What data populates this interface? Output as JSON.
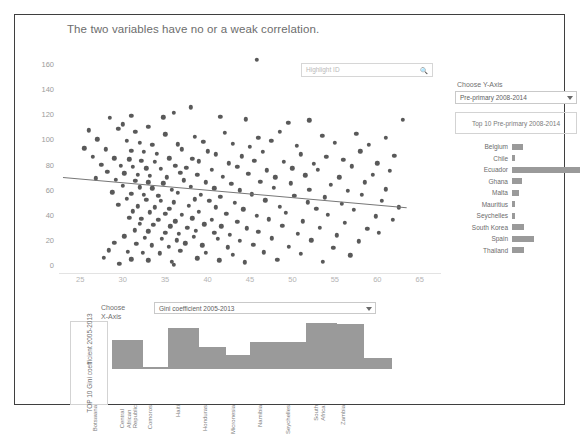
{
  "header": {
    "title": "The two variables have no or a weak correlation."
  },
  "search": {
    "placeholder": "Highlight ID",
    "icon": "magnifier-icon",
    "value": ""
  },
  "controls": {
    "y_axis_caption": "Choose Y-Axis",
    "y_axis_selected": "Pre-primary 2008-2014",
    "y_axis_top_label": "Top 10 Pre-primary 2008-2014",
    "x_axis_caption_line1": "Choose",
    "x_axis_caption_line2": "X-Axis",
    "x_axis_selected": "Gini coefficient 2005-2013",
    "dropdown_icon": "chevron-down-icon"
  },
  "bottom_panel": {
    "vertical_title": "TOP 10 Gini coefficient 2005-2013"
  },
  "colors": {
    "marker": "#595959",
    "bar": "#9a9a9a",
    "trendline": "#777777",
    "frame": "#3f3f3f",
    "axis_text": "#9b9b9b"
  },
  "chart_data": [
    {
      "type": "scatter",
      "title": "The two variables have no or a weak correlation.",
      "xlabel": "Gini coefficient 2005-2013",
      "ylabel": "Pre-primary 2008-2014",
      "xlim": [
        22.5,
        67.5
      ],
      "ylim": [
        -6,
        170
      ],
      "xticks": [
        25,
        30,
        35,
        40,
        45,
        50,
        55,
        60,
        65
      ],
      "yticks": [
        0,
        20,
        40,
        60,
        80,
        100,
        120,
        140,
        160
      ],
      "grid": false,
      "legend": "none",
      "trendline": {
        "x0": 23.0,
        "y0": 70.0,
        "x1": 63.5,
        "y1": 46.0
      },
      "points": [
        [
          45.8,
          163.0
        ],
        [
          38.0,
          125.5
        ],
        [
          31.0,
          118.5
        ],
        [
          28.5,
          117.0
        ],
        [
          34.8,
          117.5
        ],
        [
          41.5,
          118.0
        ],
        [
          44.5,
          116.0
        ],
        [
          52.0,
          115.0
        ],
        [
          63.0,
          115.5
        ],
        [
          30.0,
          112.0
        ],
        [
          33.0,
          110.0
        ],
        [
          36.0,
          121.0
        ],
        [
          49.5,
          113.0
        ],
        [
          26.0,
          107.0
        ],
        [
          29.5,
          108.5
        ],
        [
          31.5,
          106.0
        ],
        [
          35.0,
          104.0
        ],
        [
          38.5,
          102.0
        ],
        [
          42.0,
          105.0
        ],
        [
          46.0,
          101.0
        ],
        [
          48.5,
          106.0
        ],
        [
          53.5,
          103.0
        ],
        [
          57.5,
          104.5
        ],
        [
          61.0,
          101.0
        ],
        [
          27.0,
          100.0
        ],
        [
          30.5,
          99.0
        ],
        [
          32.0,
          97.0
        ],
        [
          33.5,
          95.5
        ],
        [
          36.5,
          96.0
        ],
        [
          39.5,
          98.0
        ],
        [
          43.0,
          96.5
        ],
        [
          45.0,
          94.0
        ],
        [
          47.5,
          99.0
        ],
        [
          50.5,
          95.0
        ],
        [
          55.0,
          97.0
        ],
        [
          59.0,
          95.5
        ],
        [
          25.5,
          93.0
        ],
        [
          28.0,
          92.0
        ],
        [
          31.0,
          91.0
        ],
        [
          32.5,
          90.0
        ],
        [
          34.0,
          88.5
        ],
        [
          37.0,
          92.0
        ],
        [
          40.0,
          90.5
        ],
        [
          41.0,
          88.0
        ],
        [
          44.0,
          86.5
        ],
        [
          46.5,
          90.0
        ],
        [
          51.0,
          88.0
        ],
        [
          54.0,
          86.0
        ],
        [
          58.0,
          90.5
        ],
        [
          62.0,
          87.0
        ],
        [
          26.5,
          86.0
        ],
        [
          29.0,
          85.0
        ],
        [
          30.8,
          84.0
        ],
        [
          32.2,
          83.0
        ],
        [
          33.8,
          82.0
        ],
        [
          35.5,
          85.0
        ],
        [
          38.2,
          84.5
        ],
        [
          39.0,
          82.5
        ],
        [
          42.5,
          81.0
        ],
        [
          45.5,
          83.0
        ],
        [
          49.0,
          82.0
        ],
        [
          52.5,
          80.5
        ],
        [
          56.0,
          83.5
        ],
        [
          60.0,
          81.0
        ],
        [
          27.5,
          80.0
        ],
        [
          29.8,
          79.0
        ],
        [
          31.2,
          78.0
        ],
        [
          32.8,
          77.0
        ],
        [
          34.5,
          76.5
        ],
        [
          36.2,
          79.0
        ],
        [
          37.5,
          77.5
        ],
        [
          40.5,
          76.0
        ],
        [
          43.5,
          78.0
        ],
        [
          47.0,
          75.5
        ],
        [
          50.0,
          77.0
        ],
        [
          53.0,
          76.0
        ],
        [
          57.0,
          78.5
        ],
        [
          61.5,
          75.0
        ],
        [
          28.2,
          74.0
        ],
        [
          30.2,
          73.0
        ],
        [
          31.8,
          72.0
        ],
        [
          33.2,
          71.0
        ],
        [
          35.2,
          70.0
        ],
        [
          36.8,
          73.5
        ],
        [
          38.8,
          72.0
        ],
        [
          41.8,
          70.5
        ],
        [
          44.8,
          72.5
        ],
        [
          48.0,
          70.0
        ],
        [
          51.5,
          71.5
        ],
        [
          55.5,
          70.0
        ],
        [
          59.5,
          72.0
        ],
        [
          26.8,
          69.0
        ],
        [
          29.2,
          68.0
        ],
        [
          31.5,
          67.0
        ],
        [
          33.0,
          66.0
        ],
        [
          34.8,
          65.0
        ],
        [
          37.2,
          67.5
        ],
        [
          39.8,
          66.0
        ],
        [
          42.8,
          64.5
        ],
        [
          46.2,
          66.5
        ],
        [
          49.8,
          65.0
        ],
        [
          54.5,
          64.0
        ],
        [
          58.5,
          66.0
        ],
        [
          30.0,
          63.0
        ],
        [
          32.0,
          62.0
        ],
        [
          33.5,
          61.0
        ],
        [
          35.8,
          60.0
        ],
        [
          38.0,
          62.5
        ],
        [
          40.8,
          61.0
        ],
        [
          43.8,
          59.5
        ],
        [
          47.8,
          61.5
        ],
        [
          52.0,
          60.0
        ],
        [
          56.5,
          59.0
        ],
        [
          61.0,
          60.5
        ],
        [
          28.8,
          58.0
        ],
        [
          31.0,
          57.0
        ],
        [
          32.5,
          56.0
        ],
        [
          34.2,
          55.0
        ],
        [
          36.5,
          57.5
        ],
        [
          39.2,
          56.0
        ],
        [
          41.5,
          54.5
        ],
        [
          45.2,
          56.5
        ],
        [
          50.2,
          55.0
        ],
        [
          53.8,
          54.0
        ],
        [
          58.2,
          56.0
        ],
        [
          30.5,
          53.0
        ],
        [
          32.8,
          52.0
        ],
        [
          34.5,
          51.0
        ],
        [
          36.0,
          50.0
        ],
        [
          38.5,
          52.5
        ],
        [
          40.2,
          51.0
        ],
        [
          43.2,
          49.5
        ],
        [
          46.8,
          51.5
        ],
        [
          51.8,
          50.0
        ],
        [
          55.8,
          49.0
        ],
        [
          60.5,
          51.0
        ],
        [
          29.5,
          48.0
        ],
        [
          31.8,
          47.0
        ],
        [
          33.8,
          46.0
        ],
        [
          35.5,
          45.0
        ],
        [
          37.8,
          47.5
        ],
        [
          41.0,
          46.0
        ],
        [
          44.2,
          44.5
        ],
        [
          48.5,
          46.5
        ],
        [
          52.8,
          45.0
        ],
        [
          57.2,
          44.0
        ],
        [
          62.5,
          46.0
        ],
        [
          31.2,
          43.0
        ],
        [
          33.2,
          42.0
        ],
        [
          35.0,
          41.0
        ],
        [
          37.0,
          40.0
        ],
        [
          39.0,
          42.5
        ],
        [
          42.2,
          41.0
        ],
        [
          45.8,
          39.5
        ],
        [
          49.2,
          41.5
        ],
        [
          54.2,
          40.0
        ],
        [
          59.8,
          39.0
        ],
        [
          30.8,
          38.0
        ],
        [
          32.2,
          37.0
        ],
        [
          34.2,
          36.0
        ],
        [
          36.2,
          35.0
        ],
        [
          38.2,
          37.5
        ],
        [
          40.5,
          36.0
        ],
        [
          43.5,
          34.5
        ],
        [
          47.2,
          36.5
        ],
        [
          51.2,
          35.0
        ],
        [
          56.2,
          34.0
        ],
        [
          61.8,
          36.0
        ],
        [
          32.0,
          33.0
        ],
        [
          33.6,
          32.0
        ],
        [
          35.6,
          31.0
        ],
        [
          37.6,
          30.0
        ],
        [
          39.6,
          32.5
        ],
        [
          41.6,
          31.0
        ],
        [
          44.6,
          29.5
        ],
        [
          48.8,
          31.5
        ],
        [
          53.2,
          30.0
        ],
        [
          58.8,
          29.0
        ],
        [
          31.4,
          28.0
        ],
        [
          33.0,
          27.0
        ],
        [
          35.0,
          26.0
        ],
        [
          36.6,
          25.0
        ],
        [
          38.6,
          27.5
        ],
        [
          40.8,
          26.0
        ],
        [
          42.6,
          24.5
        ],
        [
          46.0,
          26.5
        ],
        [
          50.6,
          25.0
        ],
        [
          55.2,
          24.0
        ],
        [
          60.2,
          26.0
        ],
        [
          30.2,
          23.0
        ],
        [
          32.6,
          22.0
        ],
        [
          34.6,
          21.0
        ],
        [
          36.4,
          20.0
        ],
        [
          38.4,
          22.5
        ],
        [
          41.2,
          21.0
        ],
        [
          43.8,
          19.5
        ],
        [
          47.6,
          21.5
        ],
        [
          52.2,
          20.0
        ],
        [
          57.8,
          19.0
        ],
        [
          29.0,
          18.0
        ],
        [
          31.6,
          17.0
        ],
        [
          33.4,
          16.0
        ],
        [
          35.4,
          15.0
        ],
        [
          37.4,
          17.5
        ],
        [
          39.4,
          16.0
        ],
        [
          42.4,
          14.5
        ],
        [
          45.4,
          16.5
        ],
        [
          49.6,
          15.0
        ],
        [
          54.8,
          14.0
        ],
        [
          28.4,
          12.0
        ],
        [
          30.6,
          11.0
        ],
        [
          32.4,
          10.0
        ],
        [
          34.4,
          9.5
        ],
        [
          36.8,
          11.5
        ],
        [
          39.8,
          10.0
        ],
        [
          43.0,
          8.5
        ],
        [
          46.6,
          10.5
        ],
        [
          51.0,
          9.0
        ],
        [
          56.8,
          8.0
        ],
        [
          27.8,
          6.0
        ],
        [
          31.0,
          5.0
        ],
        [
          33.0,
          4.0
        ],
        [
          35.8,
          3.0
        ],
        [
          38.8,
          5.5
        ],
        [
          41.4,
          4.0
        ],
        [
          44.4,
          2.5
        ],
        [
          48.2,
          4.5
        ],
        [
          53.6,
          3.0
        ],
        [
          29.6,
          1.5
        ],
        [
          36.0,
          0.5
        ]
      ]
    },
    {
      "type": "bar",
      "title": "Top 10 Pre-primary 2008-2014",
      "orientation": "horizontal",
      "categories": [
        "Belgium",
        "Chile",
        "Ecuador",
        "Ghana",
        "Malta",
        "Mauritius",
        "Seychelles",
        "South Korea",
        "Spain",
        "Thailand"
      ],
      "values": [
        16,
        5,
        100,
        15,
        10,
        4,
        4,
        17,
        32,
        17
      ],
      "xlabel": "",
      "ylabel": "",
      "grid": false,
      "legend": "none"
    },
    {
      "type": "bar",
      "title": "TOP 10 Gini coefficient 2005-2013",
      "orientation": "vertical",
      "categories": [
        "Botswana",
        "Central African Republic",
        "Comoros",
        "Haiti",
        "Honduras",
        "Micronesia",
        "Namibia",
        "Seychelles",
        "South Africa",
        "Zambia"
      ],
      "values": [
        60.5,
        4.0,
        84.0,
        45.0,
        28.0,
        56.0,
        56.5,
        95.0,
        92.0,
        22.0
      ],
      "xlabel": "Gini coefficient 2005-2013",
      "ylabel": "",
      "grid": false,
      "legend": "none"
    }
  ]
}
